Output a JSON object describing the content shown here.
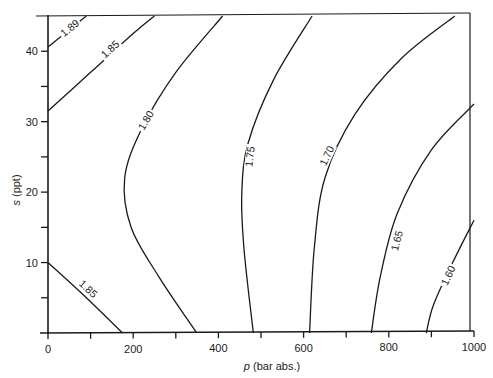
{
  "chart_data": {
    "type": "contour",
    "title": "",
    "xlabel_italic": "p",
    "xlabel_rest": " (bar abs.)",
    "ylabel_italic": "s",
    "ylabel_rest": " (ppt)",
    "xlim": [
      0,
      1000
    ],
    "ylim": [
      0,
      45
    ],
    "x_ticks": [
      0,
      200,
      400,
      600,
      800,
      1000
    ],
    "x_minor_ticks": [
      100,
      300,
      500,
      700,
      900
    ],
    "y_ticks": [
      10,
      20,
      30,
      40
    ],
    "y_minor_ticks": [
      5,
      15,
      25,
      35
    ],
    "grid": false,
    "contours": [
      {
        "level": "1.89",
        "points": [
          [
            0,
            40.6
          ],
          [
            90,
            45
          ]
        ],
        "label_at": [
          55,
          43
        ]
      },
      {
        "level": "1.85",
        "points": [
          [
            0,
            31.5
          ],
          [
            100,
            37
          ],
          [
            200,
            42.5
          ],
          [
            250,
            45
          ]
        ],
        "label_at": [
          150,
          40
        ]
      },
      {
        "level": "1.85",
        "points": [
          [
            0,
            10
          ],
          [
            90,
            5
          ],
          [
            175,
            0
          ]
        ],
        "label_at": [
          90,
          6
        ]
      },
      {
        "level": "1.80",
        "points": [
          [
            410,
            45
          ],
          [
            300,
            37
          ],
          [
            220,
            29
          ],
          [
            180,
            22
          ],
          [
            195,
            15
          ],
          [
            260,
            8
          ],
          [
            349,
            0
          ]
        ],
        "label_at": [
          235,
          30
        ]
      },
      {
        "level": "1.75",
        "points": [
          [
            620,
            45
          ],
          [
            530,
            36
          ],
          [
            470,
            27
          ],
          [
            455,
            20
          ],
          [
            460,
            12
          ],
          [
            482,
            0
          ]
        ],
        "label_at": [
          480,
          25
        ]
      },
      {
        "level": "1.70",
        "points": [
          [
            955,
            45
          ],
          [
            830,
            39
          ],
          [
            720,
            31
          ],
          [
            650,
            22
          ],
          [
            625,
            12
          ],
          [
            614,
            0
          ]
        ],
        "label_at": [
          660,
          25
        ]
      },
      {
        "level": "1.65",
        "points": [
          [
            1000,
            32.5
          ],
          [
            900,
            26
          ],
          [
            820,
            17
          ],
          [
            780,
            8
          ],
          [
            759,
            0
          ]
        ],
        "label_at": [
          825,
          13
        ]
      },
      {
        "level": "1.60",
        "points": [
          [
            1000,
            16
          ],
          [
            950,
            10
          ],
          [
            905,
            4
          ],
          [
            888,
            0
          ]
        ],
        "label_at": [
          945,
          8
        ]
      }
    ]
  }
}
